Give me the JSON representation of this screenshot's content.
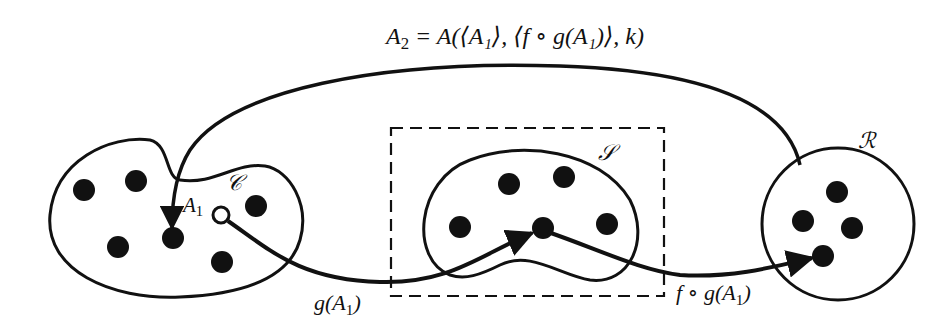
{
  "diagram": {
    "formula": {
      "lhs": "A",
      "lhs_sub": "2",
      "rhs": " = A(⟨A₁⟩, ⟨f ∘ g(A₁)⟩, k)"
    },
    "sets": [
      {
        "name": "C",
        "label": "𝒞",
        "dots": 6,
        "highlighted_point": "A₁"
      },
      {
        "name": "S",
        "label": "𝒮",
        "dots": 5,
        "inside_dashed_box": true
      },
      {
        "name": "R",
        "label": "ℛ",
        "dots": 4
      }
    ],
    "point_label": "A₁",
    "edges": [
      {
        "from": "A₁ (in C)",
        "to": "point in S",
        "label": "g(A₁)"
      },
      {
        "from": "point in S",
        "to": "point in R",
        "label": "f ∘ g(A₁)"
      },
      {
        "from": "R",
        "to": "point in C",
        "label": "A₂ = A(⟨A₁⟩, ⟨f ∘ g(A₁)⟩, k)"
      }
    ],
    "labels": {
      "set_c": "𝒞",
      "set_s": "𝒮",
      "set_r": "ℛ",
      "a1": "A",
      "a1_sub": "1",
      "g_label": "g(A",
      "g_sub": "1",
      "g_close": ")",
      "fg_label": "f ∘ g(A",
      "fg_sub": "1",
      "fg_close": ")"
    },
    "colors": {
      "ink": "#111111",
      "background": "#ffffff"
    }
  }
}
